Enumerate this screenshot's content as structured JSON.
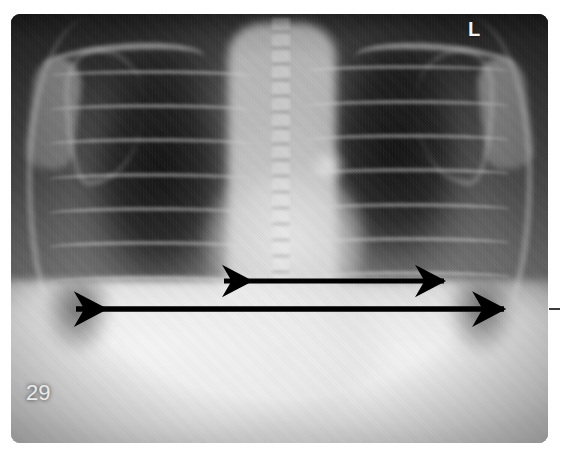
{
  "figure": {
    "type": "chest-radiograph",
    "view": "PA (posteroanterior) chest X-ray",
    "panel_number": "29",
    "side_marker": "L",
    "marker_icon": "left-side-marker-icon"
  },
  "chart_data": {
    "type": "annotated-image",
    "image_subject": "chest radiograph",
    "annotations": [
      {
        "id": "cardiac-diameter",
        "label": "cardiac transverse diameter",
        "style": "double-headed-arrow",
        "color": "#000000",
        "x1": 216,
        "x2": 452,
        "y": 281,
        "length_px": 236
      },
      {
        "id": "thoracic-diameter",
        "label": "maximal thoracic diameter",
        "style": "double-headed-arrow",
        "color": "#000000",
        "x1": 68,
        "x2": 512,
        "y": 309,
        "length_px": 444
      }
    ],
    "text_overlays": [
      {
        "id": "panel-number",
        "text": "29",
        "x": 26,
        "y": 380,
        "color": "#eaeaea"
      },
      {
        "id": "side-marker",
        "text": "L",
        "x": 468,
        "y": 18,
        "color": "#f2f2f2"
      }
    ],
    "plate": {
      "x": 11,
      "y": 14,
      "width": 537,
      "height": 429,
      "corner_radius": 9
    },
    "background_color": "#ffffff"
  },
  "arrows": {
    "cardiac": {
      "name": "cardiac-diameter-arrow",
      "title": "Cardiac transverse diameter measurement arrow"
    },
    "thoracic": {
      "name": "thoracic-diameter-arrow",
      "title": "Maximal thoracic diameter measurement arrow"
    }
  },
  "anatomy": {
    "regions": [
      "right lung field",
      "left lung field",
      "mediastinum",
      "cardiac silhouette",
      "thoracic spine",
      "ribs",
      "clavicles",
      "diaphragm",
      "costophrenic angles"
    ]
  }
}
